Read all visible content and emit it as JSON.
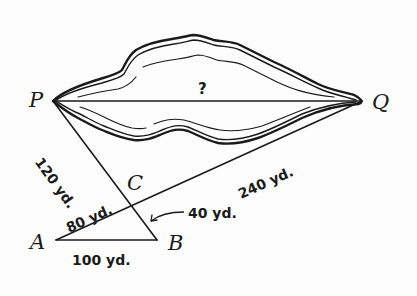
{
  "diagram": {
    "type": "geometry-similar-triangles",
    "points": {
      "P": {
        "label": "P"
      },
      "Q": {
        "label": "Q"
      },
      "C": {
        "label": "C"
      },
      "A": {
        "label": "A"
      },
      "B": {
        "label": "B"
      }
    },
    "segments": {
      "PQ": {
        "label": "?"
      },
      "PC": {
        "label": "120 yd."
      },
      "CQ": {
        "label": "240 yd."
      },
      "AC": {
        "label": "80 yd."
      },
      "CB": {
        "label": "40 yd."
      },
      "AB": {
        "label": "100 yd."
      }
    },
    "colors": {
      "ink": "#1a1a1a",
      "paper": "#fdfdfd"
    }
  }
}
